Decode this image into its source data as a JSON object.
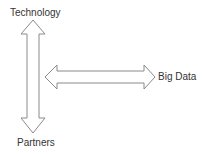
{
  "diagram": {
    "nodes": {
      "top": {
        "label": "Technology"
      },
      "bottom": {
        "label": "Partners"
      },
      "right": {
        "label": "Big Data"
      }
    },
    "edges": [
      {
        "from": "Technology",
        "to": "Partners",
        "type": "double-headed-block-arrow",
        "orientation": "vertical"
      },
      {
        "from": "vertical-arrow",
        "to": "Big Data",
        "type": "double-headed-block-arrow",
        "orientation": "horizontal"
      }
    ],
    "colors": {
      "arrow_stroke": "#8a8a8a",
      "arrow_fill": "#ffffff",
      "text": "#333333"
    }
  }
}
